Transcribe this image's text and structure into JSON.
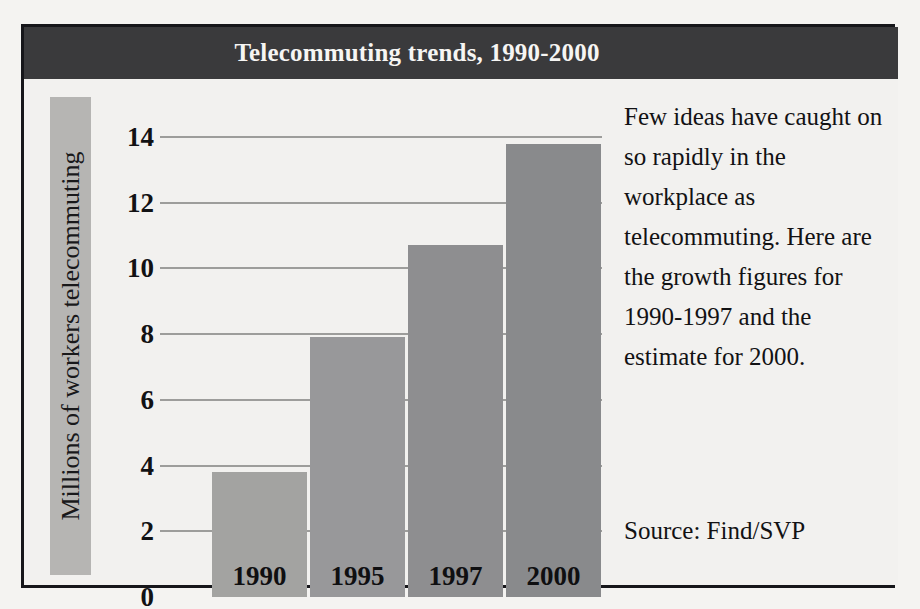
{
  "figure": {
    "title": "Telecommuting trends, 1990-2000",
    "title_bar_color": "#3a3a3c",
    "frame_color": "#16161a",
    "background_color": "#f2f1ef"
  },
  "side_panel": {
    "body": "Few ideas have caught on so rapidly in the workplace as telecommuting. Here are the growth figures for 1990-1997 and the estimate for 2000.",
    "source": "Source: Find/SVP"
  },
  "chart_data": {
    "type": "bar",
    "title": "Telecommuting trends, 1990-2000",
    "xlabel": "",
    "ylabel": "Millions of workers telecommuting",
    "categories": [
      "1990",
      "1995",
      "1997",
      "2000"
    ],
    "values": [
      3.8,
      7.9,
      10.7,
      13.8
    ],
    "series": [
      {
        "name": "Millions of workers telecommuting",
        "values": [
          3.8,
          7.9,
          10.7,
          13.8
        ]
      }
    ],
    "ylim": [
      0,
      14
    ],
    "yticks": [
      0,
      2,
      4,
      6,
      8,
      10,
      12,
      14
    ],
    "ytick_labels": [
      "0",
      "2",
      "4",
      "6",
      "8",
      "10",
      "12",
      "14"
    ],
    "grid": true,
    "gridline_color": "#9d9d9b",
    "legend": false,
    "legend_position": "none",
    "bar_colors": [
      "#a3a3a1",
      "#98989a",
      "#8e8e90",
      "#898a8c"
    ],
    "category_labels_inside_bars": true,
    "annotations": [
      "Few ideas have caught on so rapidly in the workplace as telecommuting. Here are the growth figures for 1990-1997 and the estimate for 2000.",
      "Source: Find/SVP"
    ]
  }
}
